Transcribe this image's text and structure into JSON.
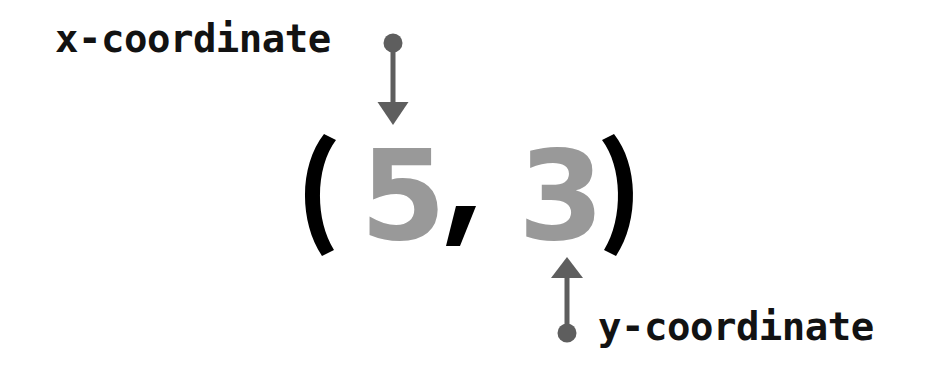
{
  "diagram": {
    "background_color": "#ffffff",
    "canvas": {
      "width": 940,
      "height": 372
    }
  },
  "coordinate_pair": {
    "open_paren": "(",
    "x_value": "5",
    "separator": ",",
    "y_value": "3",
    "close_paren": ")",
    "full_text": "(5, 3)",
    "bracket_color": "#000000",
    "comma_color": "#000000",
    "digit_color": "#999999"
  },
  "annotations": [
    {
      "id": "x-coordinate",
      "label": "x-coordinate",
      "label_color": "#121212",
      "points_to": "5",
      "arrow_direction": "down",
      "arrow_color": "#5e5e5e",
      "dot_end": "start"
    },
    {
      "id": "y-coordinate",
      "label": "y-coordinate",
      "label_color": "#121212",
      "points_to": "3",
      "arrow_direction": "up",
      "arrow_color": "#5e5e5e",
      "dot_end": "start"
    }
  ],
  "icons": {
    "arrow_down": "arrow-down-icon",
    "arrow_up": "arrow-up-icon",
    "dot": "dot-marker-icon"
  }
}
